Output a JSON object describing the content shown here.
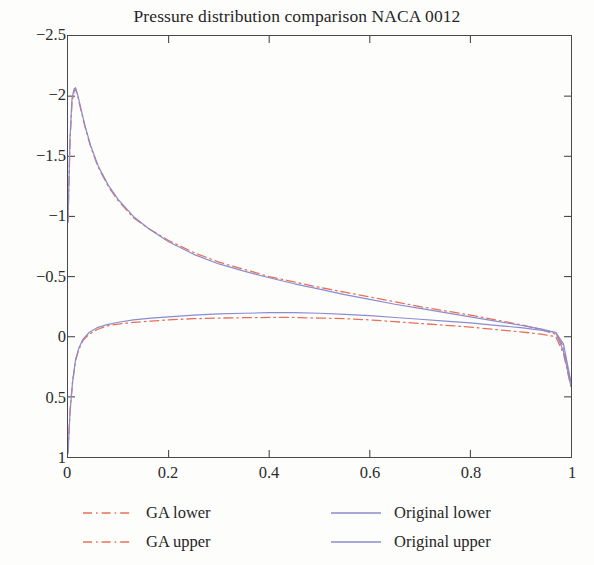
{
  "chart_data": {
    "type": "line",
    "title": "Pressure distribution comparison NACA 0012",
    "xlabel": "",
    "ylabel": "",
    "xlim": [
      0,
      1
    ],
    "ylim": [
      1,
      -2.5
    ],
    "y_axis_inverted": true,
    "grid": false,
    "legend_position": "below-plot",
    "xticks": [
      "0",
      "0.2",
      "0.4",
      "0.6",
      "0.8",
      "1"
    ],
    "xtick_values": [
      0,
      0.2,
      0.4,
      0.6,
      0.8,
      1
    ],
    "yticks": [
      "−2.5",
      "−2",
      "−1.5",
      "−1",
      "−0.5",
      "0",
      "0.5",
      "1"
    ],
    "ytick_values": [
      -2.5,
      -2,
      -1.5,
      -1,
      -0.5,
      0,
      0.5,
      1
    ],
    "series": [
      {
        "name": "GA lower",
        "color": "#e8705a",
        "style": "dashdot",
        "x": [
          0.0,
          0.004,
          0.009,
          0.015,
          0.022,
          0.03,
          0.042,
          0.058,
          0.078,
          0.1,
          0.13,
          0.165,
          0.2,
          0.25,
          0.3,
          0.35,
          0.4,
          0.45,
          0.5,
          0.55,
          0.6,
          0.65,
          0.7,
          0.75,
          0.8,
          0.85,
          0.9,
          0.94,
          0.97,
          0.985,
          1.0
        ],
        "y": [
          0.96,
          0.62,
          0.38,
          0.2,
          0.1,
          0.03,
          -0.02,
          -0.06,
          -0.09,
          -0.105,
          -0.12,
          -0.13,
          -0.14,
          -0.15,
          -0.155,
          -0.158,
          -0.16,
          -0.16,
          -0.155,
          -0.15,
          -0.14,
          -0.125,
          -0.11,
          -0.095,
          -0.08,
          -0.06,
          -0.04,
          -0.022,
          0.0,
          0.14,
          0.42
        ]
      },
      {
        "name": "GA upper",
        "color": "#e8705a",
        "style": "dashdot",
        "x": [
          0.0,
          0.004,
          0.008,
          0.012,
          0.015,
          0.02,
          0.026,
          0.034,
          0.045,
          0.06,
          0.08,
          0.1,
          0.13,
          0.16,
          0.2,
          0.25,
          0.3,
          0.35,
          0.4,
          0.45,
          0.5,
          0.55,
          0.6,
          0.65,
          0.7,
          0.75,
          0.8,
          0.85,
          0.9,
          0.94,
          0.97,
          0.985,
          1.0
        ],
        "y": [
          -0.95,
          -1.62,
          -1.95,
          -2.04,
          -2.06,
          -1.99,
          -1.88,
          -1.74,
          -1.58,
          -1.41,
          -1.25,
          -1.13,
          -0.99,
          -0.9,
          -0.8,
          -0.7,
          -0.62,
          -0.56,
          -0.5,
          -0.455,
          -0.41,
          -0.37,
          -0.33,
          -0.29,
          -0.25,
          -0.215,
          -0.18,
          -0.14,
          -0.1,
          -0.06,
          -0.02,
          0.08,
          0.4
        ]
      },
      {
        "name": "Original lower",
        "color": "#8b8bcf",
        "style": "solid",
        "x": [
          0.0,
          0.004,
          0.009,
          0.015,
          0.022,
          0.03,
          0.042,
          0.058,
          0.078,
          0.1,
          0.13,
          0.165,
          0.2,
          0.25,
          0.3,
          0.35,
          0.4,
          0.45,
          0.5,
          0.55,
          0.6,
          0.65,
          0.7,
          0.75,
          0.8,
          0.85,
          0.9,
          0.94,
          0.97,
          0.985,
          1.0
        ],
        "y": [
          0.97,
          0.63,
          0.38,
          0.19,
          0.09,
          0.02,
          -0.035,
          -0.075,
          -0.1,
          -0.12,
          -0.14,
          -0.155,
          -0.165,
          -0.18,
          -0.19,
          -0.195,
          -0.2,
          -0.2,
          -0.195,
          -0.185,
          -0.175,
          -0.16,
          -0.145,
          -0.13,
          -0.115,
          -0.095,
          -0.075,
          -0.055,
          -0.035,
          0.12,
          0.41
        ]
      },
      {
        "name": "Original upper",
        "color": "#8b8bcf",
        "style": "solid",
        "x": [
          0.0,
          0.004,
          0.008,
          0.012,
          0.015,
          0.02,
          0.026,
          0.034,
          0.045,
          0.06,
          0.08,
          0.1,
          0.13,
          0.16,
          0.2,
          0.25,
          0.3,
          0.35,
          0.4,
          0.45,
          0.5,
          0.55,
          0.6,
          0.65,
          0.7,
          0.75,
          0.8,
          0.85,
          0.9,
          0.94,
          0.97,
          0.985,
          1.0
        ],
        "y": [
          -0.96,
          -1.66,
          -1.98,
          -2.06,
          -2.07,
          -2.0,
          -1.89,
          -1.75,
          -1.59,
          -1.42,
          -1.26,
          -1.14,
          -1.0,
          -0.9,
          -0.79,
          -0.685,
          -0.605,
          -0.545,
          -0.49,
          -0.44,
          -0.395,
          -0.35,
          -0.31,
          -0.27,
          -0.235,
          -0.2,
          -0.165,
          -0.13,
          -0.095,
          -0.065,
          -0.035,
          0.06,
          0.38
        ]
      }
    ]
  },
  "legend": {
    "entries": [
      {
        "label": "GA lower",
        "color": "#e8705a",
        "style": "dashdot",
        "column": "left"
      },
      {
        "label": "GA upper",
        "color": "#e8705a",
        "style": "dashdot",
        "column": "left"
      },
      {
        "label": "Original lower",
        "color": "#8b8bcf",
        "style": "solid",
        "column": "right"
      },
      {
        "label": "Original upper",
        "color": "#8b8bcf",
        "style": "solid",
        "column": "right"
      }
    ]
  },
  "colors": {
    "ga": "#e8705a",
    "original": "#8b8bcf",
    "axis": "#4a4a4a",
    "text": "#262626",
    "background": "#fdfdfc"
  }
}
